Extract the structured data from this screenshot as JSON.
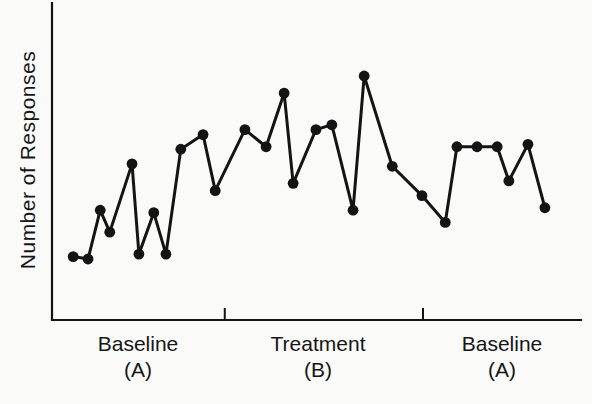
{
  "page": {
    "background_color": "#fafaf9",
    "ink_color": "#161616"
  },
  "chart_data": {
    "type": "line",
    "title": "",
    "xlabel": "",
    "ylabel": "Number of Responses",
    "axes_numeric_labels_shown": false,
    "legend": "none",
    "grid": false,
    "marker": "filled-circle",
    "line_color": "#141414",
    "marker_color": "#141414",
    "x_range": [
      0,
      100
    ],
    "y_range": [
      0,
      110
    ],
    "x": [
      4.0,
      6.8,
      9.1,
      10.9,
      15.1,
      16.4,
      19.2,
      21.5,
      24.3,
      28.5,
      30.8,
      36.4,
      40.4,
      43.8,
      45.5,
      49.8,
      52.8,
      56.8,
      58.9,
      64.2,
      69.8,
      74.2,
      76.4,
      80.2,
      84.0,
      86.2,
      89.8,
      93.0
    ],
    "values": [
      26,
      25,
      45,
      36,
      64,
      27,
      44,
      27,
      70,
      76,
      53,
      78,
      71,
      93,
      56,
      78,
      80,
      45,
      100,
      63,
      51,
      40,
      71,
      71,
      71,
      57,
      72,
      46
    ],
    "values_unit": "arbitrary (axis unlabeled)",
    "phase_boundary_ticks_x": [
      32.6,
      70.0
    ],
    "phases": [
      {
        "label": "Baseline",
        "sublabel": "(A)",
        "center_x": 16.3,
        "num_points": 11
      },
      {
        "label": "Treatment",
        "sublabel": "(B)",
        "center_x": 50.2,
        "num_points": 10
      },
      {
        "label": "Baseline",
        "sublabel": "(A)",
        "center_x": 85.0,
        "num_points": 7
      }
    ]
  }
}
